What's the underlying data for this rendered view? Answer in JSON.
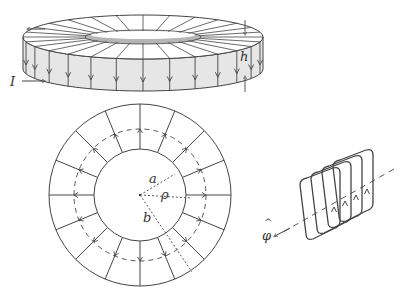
{
  "labels": {
    "current": "I",
    "height": "h",
    "inner_radius": "a",
    "radial": "ρ",
    "outer_radius": "b",
    "phi_hat": "φ",
    "phi_hat_caret": "^"
  },
  "colors": {
    "stroke": "#444444",
    "face": "#e6e6e6",
    "inner_band": "#b5b5b5",
    "background": "#ffffff"
  },
  "geometry": {
    "toroid_3d": {
      "cx": 143,
      "top_cy": 37,
      "rx": 120,
      "ry": 22,
      "height": 32,
      "inner_rx": 58,
      "inner_ry": 6
    },
    "top_view": {
      "cx": 140,
      "cy": 195,
      "outer_r": 91,
      "inner_r": 46,
      "dashed_r": 66,
      "spokes": 16
    },
    "coil": {
      "loops": 4
    }
  }
}
